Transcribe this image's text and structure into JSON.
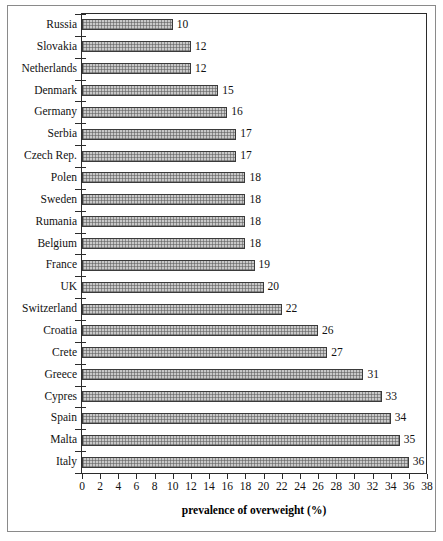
{
  "chart_data": {
    "type": "bar",
    "orientation": "horizontal",
    "title": "",
    "xlabel": "prevalence of overweight (%)",
    "ylabel": "",
    "xlim": [
      0,
      38
    ],
    "xticks": [
      0,
      2,
      4,
      6,
      8,
      10,
      12,
      14,
      16,
      18,
      20,
      22,
      24,
      26,
      28,
      30,
      32,
      34,
      36,
      38
    ],
    "grid": false,
    "legend": false,
    "categories": [
      "Russia",
      "Slovakia",
      "Netherlands",
      "Denmark",
      "Germany",
      "Serbia",
      "Czech Rep.",
      "Polen",
      "Sweden",
      "Rumania",
      "Belgium",
      "France",
      "UK",
      "Switzerland",
      "Croatia",
      "Crete",
      "Greece",
      "Cypres",
      "Spain",
      "Malta",
      "Italy"
    ],
    "values": [
      10,
      12,
      12,
      15,
      16,
      17,
      17,
      18,
      18,
      18,
      18,
      19,
      20,
      22,
      26,
      27,
      31,
      33,
      34,
      35,
      36
    ],
    "data_labels": [
      "10",
      "12",
      "12",
      "15",
      "16",
      "17",
      "17",
      "18",
      "18",
      "18",
      "18",
      "19",
      "20",
      "22",
      "26",
      "27",
      "31",
      "33",
      "34",
      "35",
      "36"
    ],
    "bar_fill_color": "#c9c9c9",
    "bar_edge_color": "#3a3a3a",
    "axis_color": "#2b2b2b",
    "background_color": "#ffffff"
  }
}
